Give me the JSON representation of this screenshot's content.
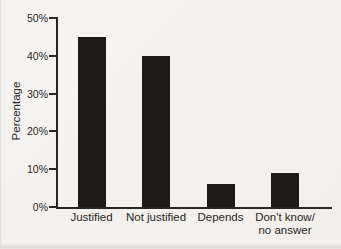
{
  "chart_data": {
    "type": "bar",
    "categories": [
      "Justified",
      "Not justified",
      "Depends",
      "Don't know/\nno answer"
    ],
    "values": [
      45,
      40,
      6,
      9
    ],
    "title": "",
    "xlabel": "",
    "ylabel": "Percentage",
    "ylim": [
      0,
      50
    ],
    "ytick_step": 10,
    "ytick_labels": [
      "0%",
      "10%",
      "20%",
      "30%",
      "40%",
      "50%"
    ],
    "grid": false,
    "legend": "none",
    "bar_color": "#1d1a1a",
    "axis_color": "#2a2625",
    "text_color": "#2a2625",
    "background_color": "#f4f3f0"
  }
}
